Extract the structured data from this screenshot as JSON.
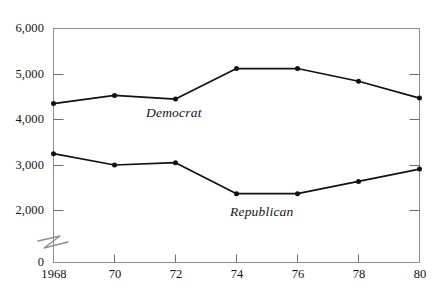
{
  "chart_data": {
    "type": "line",
    "title": "",
    "subtitle": "",
    "xlabel": "",
    "ylabel": "",
    "x": [
      1968,
      1970,
      1972,
      1974,
      1976,
      1978,
      1980
    ],
    "categories": [
      "1968",
      "70",
      "72",
      "74",
      "76",
      "78",
      "80"
    ],
    "series": [
      {
        "name": "Democrat",
        "values": [
          4350,
          4530,
          4450,
          5120,
          5120,
          4840,
          4470
        ],
        "label_x": 1971.4,
        "label_y": 4080,
        "color": "#111111"
      },
      {
        "name": "Republican",
        "values": [
          3250,
          3000,
          3050,
          2370,
          2370,
          2640,
          2910
        ],
        "label_x": 1974.5,
        "label_y": 2120,
        "color": "#111111"
      }
    ],
    "ylim": [
      2000,
      6000
    ],
    "yticks": [
      2000,
      3000,
      4000,
      5000,
      6000
    ],
    "ytick_labels": [
      "2,000",
      "3,000",
      "4,000",
      "5,000",
      "6,000"
    ],
    "y_zero_label": "0",
    "xlim": [
      1968,
      1980
    ],
    "xticks": [
      1968,
      1970,
      1972,
      1974,
      1976,
      1978,
      1980
    ],
    "xtick_labels": [
      "1968",
      "70",
      "72",
      "74",
      "76",
      "78",
      "80"
    ],
    "axis_break": true,
    "axis_break_note": "broken y-axis between 0 and 2,000",
    "grid": false,
    "legend": "inline-series-labels",
    "frame": "box",
    "marker": "filled-circle",
    "line_color": "#111111",
    "frame_color": "#8a8a8a",
    "text_color": "#141414"
  }
}
